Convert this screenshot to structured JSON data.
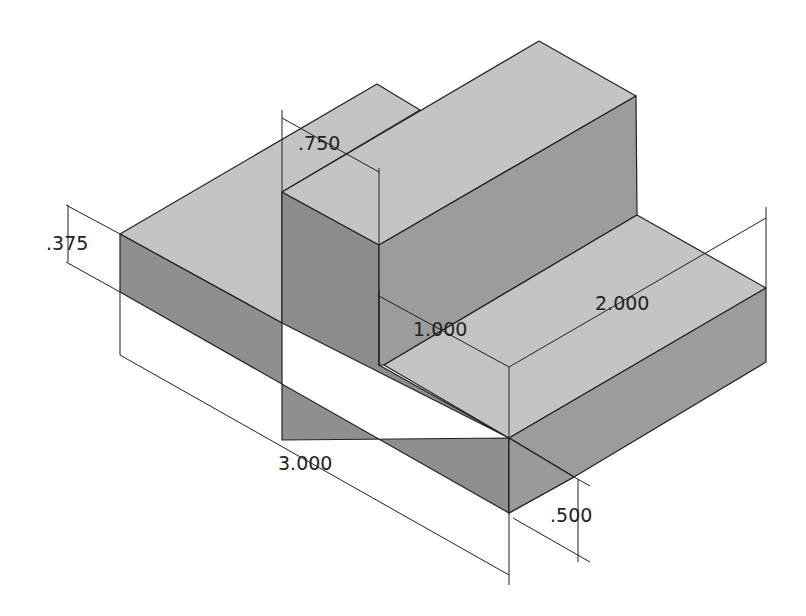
{
  "diagram": {
    "type": "isometric-part-drawing",
    "colors": {
      "top_face": "#c3c3c3",
      "left_face": "#8f8f8f",
      "right_face": "#9f9f9f",
      "edge": "#222222",
      "background": "#ffffff"
    },
    "dimensions": [
      {
        "id": "width_upper",
        "label": ".750"
      },
      {
        "id": "base_thickness",
        "label": ".375"
      },
      {
        "id": "step_depth",
        "label": "1.000"
      },
      {
        "id": "step_length",
        "label": "2.000"
      },
      {
        "id": "overall_length",
        "label": "3.000"
      },
      {
        "id": "step_height",
        "label": ".500"
      }
    ]
  }
}
